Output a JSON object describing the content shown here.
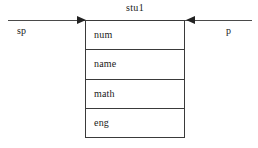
{
  "diagram": {
    "type": "struct-pointer-diagram",
    "background_color": "#ffffff",
    "line_color": "#3a3a3a",
    "text_color": "#1a1a1a",
    "struct": {
      "name": "stu1",
      "fields": [
        {
          "label": "num"
        },
        {
          "label": "name"
        },
        {
          "label": "math"
        },
        {
          "label": "eng"
        }
      ]
    },
    "pointers": [
      {
        "label": "sp",
        "side": "left",
        "direction": "right",
        "arrow_glyph": "solid-triangle-right"
      },
      {
        "label": "p",
        "side": "right",
        "direction": "left",
        "arrow_glyph": "solid-triangle-left"
      }
    ]
  }
}
